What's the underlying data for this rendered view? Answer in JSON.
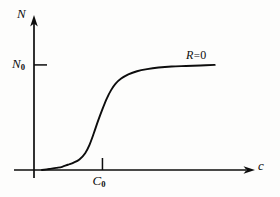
{
  "figure": {
    "background_color": "#fdfdfc",
    "ink_color": "#0d0d0d"
  },
  "labels": {
    "y_axis": "N",
    "y_tick_base": "N",
    "y_tick_sub": "0",
    "x_axis": "c",
    "x_tick_base": "C",
    "x_tick_sub": "0",
    "curve_base": "R",
    "curve_eq": "=",
    "curve_value": "0"
  },
  "chart_data": {
    "type": "line",
    "title": "",
    "subtitle": "",
    "xlabel": "c",
    "ylabel": "N",
    "grid": false,
    "legend": null,
    "xlim": [
      0,
      1.32
    ],
    "ylim": [
      0,
      1.18
    ],
    "axis_style": "arrow-ended",
    "x_ticks": [
      {
        "value": 0.42,
        "label": "C0",
        "display": "C₀"
      }
    ],
    "y_ticks": [
      {
        "value": 1.0,
        "label": "N0",
        "display": "N₀"
      }
    ],
    "annotations": [
      {
        "text": "R = 0",
        "x": 0.88,
        "y": 0.92,
        "target": "plateau of sigmoid curve"
      }
    ],
    "series": [
      {
        "name": "R = 0",
        "shape": "sigmoid",
        "color": "#0d0d0d",
        "linewidth": 1.9,
        "inflection_x": 0.42,
        "asymptote_y": 1.0,
        "x": [
          0.0,
          0.05,
          0.1,
          0.14,
          0.18,
          0.22,
          0.26,
          0.3,
          0.33,
          0.36,
          0.39,
          0.42,
          0.45,
          0.48,
          0.51,
          0.55,
          0.6,
          0.66,
          0.73,
          0.81,
          0.9,
          1.0,
          1.1,
          1.2
        ],
        "y": [
          0.0,
          0.01,
          0.02,
          0.03,
          0.05,
          0.07,
          0.1,
          0.16,
          0.24,
          0.35,
          0.47,
          0.58,
          0.68,
          0.76,
          0.82,
          0.87,
          0.91,
          0.94,
          0.96,
          0.975,
          0.985,
          0.99,
          0.995,
          1.0
        ]
      }
    ]
  }
}
